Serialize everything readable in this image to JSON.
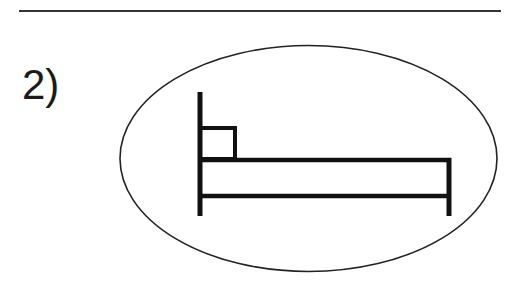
{
  "item": {
    "number_label": "2)",
    "symbol": "bed-icon",
    "enclosure": "ellipse"
  },
  "colors": {
    "stroke": "#1a1a1a",
    "background": "#ffffff"
  }
}
